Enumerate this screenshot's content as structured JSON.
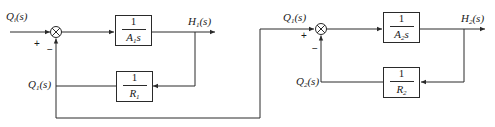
{
  "diagram": {
    "type": "block-diagram",
    "line_color": "#2a2a2a",
    "signals": {
      "input": {
        "text": "Q",
        "sub": "i",
        "tail": "(s)"
      },
      "h1": {
        "text": "H",
        "sub": "1",
        "tail": "(s)"
      },
      "q1_feedback": {
        "text": "Q",
        "sub": "1",
        "tail": "(s)"
      },
      "q1_input2": {
        "text": "Q",
        "sub": "1",
        "tail": "(s)"
      },
      "h2": {
        "text": "H",
        "sub": "2",
        "tail": "(s)"
      },
      "q2_feedback": {
        "text": "Q",
        "sub": "2",
        "tail": "(s)"
      }
    },
    "signs": {
      "sum1_plus": "+",
      "sum1_minus": "−",
      "sum2_plus": "+",
      "sum2_minus": "−"
    },
    "blocks": {
      "forward1": {
        "numerator": "1",
        "den_main": "A",
        "den_sub": "1",
        "den_tail": "s"
      },
      "feedback1": {
        "numerator": "1",
        "den_main": "R",
        "den_sub": "1",
        "den_tail": ""
      },
      "forward2": {
        "numerator": "1",
        "den_main": "A",
        "den_sub": "2",
        "den_tail": "s"
      },
      "feedback2": {
        "numerator": "1",
        "den_main": "R",
        "den_sub": "2",
        "den_tail": ""
      }
    }
  }
}
